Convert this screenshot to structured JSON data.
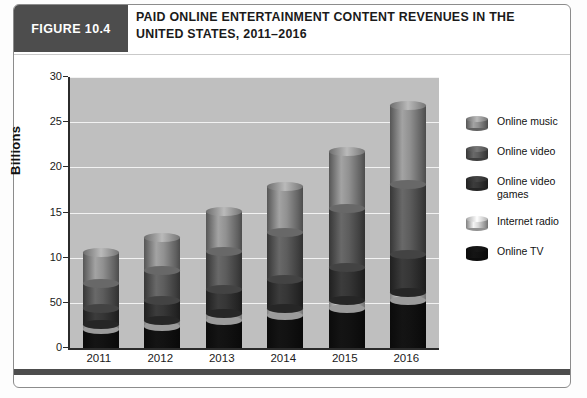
{
  "figure": {
    "badge": "FIGURE 10.4",
    "title": "PAID ONLINE ENTERTAINMENT CONTENT REVENUES IN THE UNITED STATES, 2011–2016"
  },
  "colors": {
    "plot_background": "#bfbfbf",
    "gridline": "#f2f2f2",
    "axis": "#2b2b2b",
    "badge_background": "#4d4d4d",
    "online_music": "#8a8a8a",
    "online_video": "#595959",
    "online_video_games": "#333333",
    "internet_radio": "#cfcfcf",
    "online_tv": "#111111"
  },
  "legend": {
    "items": [
      {
        "label": "Online music",
        "color": "#8a8a8a",
        "icon": "cylinder-swatch"
      },
      {
        "label": "Online video",
        "color": "#595959",
        "icon": "cylinder-swatch"
      },
      {
        "label": "Online video games",
        "color": "#333333",
        "icon": "cylinder-swatch"
      },
      {
        "label": "Internet radio",
        "color": "#cfcfcf",
        "icon": "cylinder-swatch"
      },
      {
        "label": "Online TV",
        "color": "#111111",
        "icon": "cylinder-swatch"
      }
    ]
  },
  "chart_data": {
    "type": "bar",
    "subtype": "stacked-3d-cylinder",
    "title": "Paid online entertainment content revenues in the United States, 2011–2016",
    "xlabel": "",
    "ylabel": "Billions",
    "categories": [
      "2011",
      "2012",
      "2013",
      "2014",
      "2015",
      "2016"
    ],
    "ylim": [
      0,
      30
    ],
    "ytick_labels": [
      "0",
      "50",
      "10",
      "15",
      "20",
      "25",
      "30"
    ],
    "ytick_values": [
      0,
      5,
      10,
      15,
      20,
      25,
      30
    ],
    "grid": true,
    "grid_axis": "y",
    "legend_position": "right",
    "stack_order_bottom_to_top": [
      "Online TV",
      "Internet radio",
      "Online video games",
      "Online video",
      "Online music"
    ],
    "series": [
      {
        "name": "Online TV",
        "color": "#111111",
        "values": [
          2.0,
          2.4,
          3.0,
          3.6,
          4.4,
          5.3
        ]
      },
      {
        "name": "Internet radio",
        "color": "#cfcfcf",
        "values": [
          0.6,
          0.7,
          0.8,
          0.8,
          0.9,
          0.9
        ]
      },
      {
        "name": "Online video games",
        "color": "#333333",
        "values": [
          1.8,
          2.2,
          2.7,
          3.2,
          3.6,
          4.1
        ]
      },
      {
        "name": "Online video",
        "color": "#595959",
        "values": [
          2.7,
          3.3,
          4.2,
          5.2,
          6.5,
          7.8
        ]
      },
      {
        "name": "Online music",
        "color": "#8a8a8a",
        "values": [
          3.5,
          3.6,
          4.4,
          5.1,
          6.3,
          8.8
        ]
      }
    ],
    "totals": [
      10.6,
      12.2,
      15.1,
      17.9,
      21.7,
      26.9
    ]
  }
}
